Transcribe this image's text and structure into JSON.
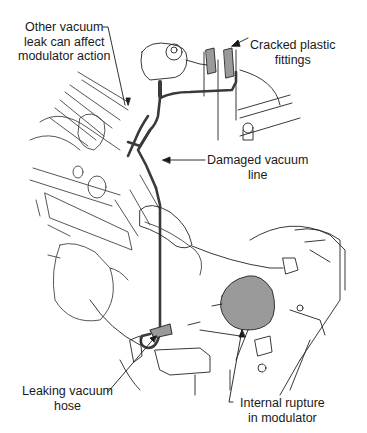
{
  "diagram": {
    "colors": {
      "line_art": "#222222",
      "vacuum_line": "#3a3a3a",
      "highlight_fill": "#9a9a9a",
      "background": "#ffffff"
    },
    "callouts": [
      {
        "id": "other-leak",
        "lines": [
          "Other vacuum",
          "leak can affect",
          "modulator action"
        ]
      },
      {
        "id": "cracked-fittings",
        "lines": [
          "Cracked plastic",
          "fittings"
        ]
      },
      {
        "id": "damaged-line",
        "lines": [
          "Damaged vacuum",
          "line"
        ]
      },
      {
        "id": "leaking-hose",
        "lines": [
          "Leaking vacuum",
          "hose"
        ]
      },
      {
        "id": "internal-rupture",
        "lines": [
          "Internal rupture",
          "in modulator"
        ]
      }
    ]
  }
}
